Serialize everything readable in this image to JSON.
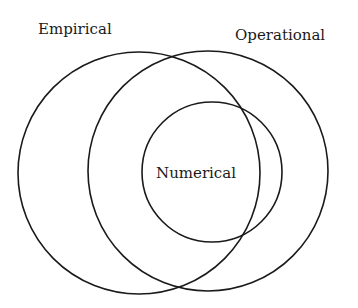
{
  "diagram": {
    "type": "venn",
    "sets": [
      {
        "id": "empirical",
        "label": "Empirical",
        "cx": 139,
        "cy": 173,
        "r": 121,
        "label_x": 38,
        "label_y": 34
      },
      {
        "id": "operational",
        "label": "Operational",
        "cx": 208,
        "cy": 171,
        "r": 120,
        "label_x": 235,
        "label_y": 40
      },
      {
        "id": "numerical",
        "label": "Numerical",
        "cx": 212,
        "cy": 172,
        "r": 70,
        "label_x": 156,
        "label_y": 178
      }
    ],
    "stroke_color": "#1a1a1a",
    "background": "#ffffff"
  }
}
